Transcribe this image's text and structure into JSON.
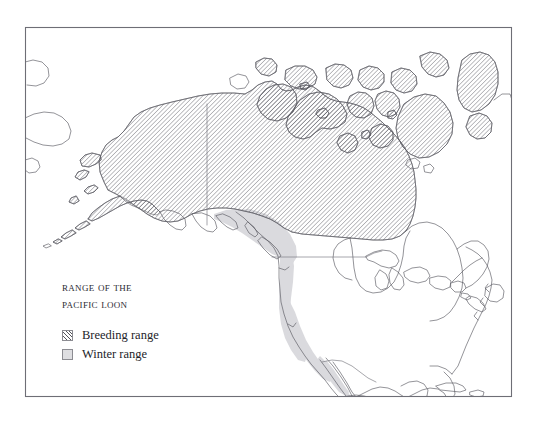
{
  "figure": {
    "type": "range-map",
    "subject": "Pacific Loon",
    "region": "North America",
    "background_color": "#ffffff",
    "frame": {
      "name": "map-border",
      "color": "#6e6e76",
      "x": 25,
      "y": 27,
      "width": 487,
      "height": 370
    }
  },
  "legend": {
    "title_line1": "Range of the",
    "title_line2": "Pacific Loon",
    "items": [
      {
        "label": "Breeding range",
        "swatch": "hatched-diagonal",
        "color": "#55555c"
      },
      {
        "label": "Winter range",
        "swatch": "solid-fill",
        "color": "#dedee1"
      }
    ]
  },
  "map_layers": {
    "coastline": {
      "name": "coastline-outline",
      "stroke": "#5a5a62",
      "fill": "#ffffff"
    },
    "breeding": {
      "name": "breeding-range-hatch",
      "pattern": "diagonal-45",
      "stroke": "#55555c"
    },
    "winter": {
      "name": "winter-range-fill",
      "color": "#d9d9dd"
    },
    "borders": {
      "name": "political-borders",
      "stroke": "#77777e"
    }
  },
  "labels": {
    "alaska_yukon_border": "Alaska–Yukon border",
    "us_canada_border": "49th parallel border"
  }
}
